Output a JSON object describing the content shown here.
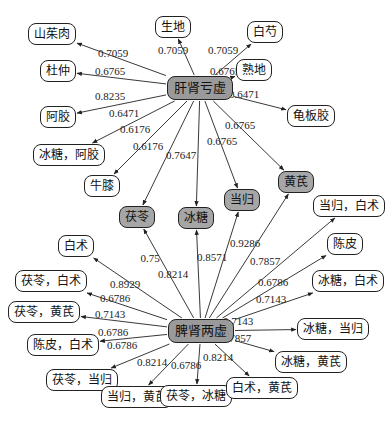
{
  "hubs": [
    {
      "id": "gsky",
      "label": "肝肾亏虚",
      "x": 200,
      "y": 88
    },
    {
      "id": "psly",
      "label": "脾肾两虚",
      "x": 201,
      "y": 331
    }
  ],
  "nodes": [
    {
      "id": "n1",
      "label": "山茱肉",
      "x": 52,
      "y": 34,
      "type": "leaf"
    },
    {
      "id": "n2",
      "label": "生地",
      "x": 173,
      "y": 27,
      "type": "leaf"
    },
    {
      "id": "n3",
      "label": "白芍",
      "x": 265,
      "y": 32,
      "type": "leaf"
    },
    {
      "id": "n4",
      "label": "杜仲",
      "x": 58,
      "y": 71,
      "type": "leaf"
    },
    {
      "id": "n5",
      "label": "熟地",
      "x": 254,
      "y": 70,
      "type": "leaf"
    },
    {
      "id": "n6",
      "label": "阿胶",
      "x": 58,
      "y": 117,
      "type": "leaf"
    },
    {
      "id": "n7",
      "label": "龟板胶",
      "x": 311,
      "y": 116,
      "type": "leaf"
    },
    {
      "id": "n8",
      "label": "冰糖，阿胶",
      "x": 69,
      "y": 155,
      "type": "leaf"
    },
    {
      "id": "n9",
      "label": "牛膝",
      "x": 102,
      "y": 186,
      "type": "leaf"
    },
    {
      "id": "n10",
      "label": "茯苓",
      "x": 137,
      "y": 217,
      "type": "shared"
    },
    {
      "id": "n11",
      "label": "冰糖",
      "x": 196,
      "y": 218,
      "type": "shared"
    },
    {
      "id": "n12",
      "label": "当归",
      "x": 242,
      "y": 200,
      "type": "shared"
    },
    {
      "id": "n13",
      "label": "黄芪",
      "x": 296,
      "y": 182,
      "type": "shared"
    },
    {
      "id": "n14",
      "label": "当归，白术",
      "x": 349,
      "y": 206,
      "type": "leaf"
    },
    {
      "id": "n15",
      "label": "陈皮",
      "x": 345,
      "y": 244,
      "type": "leaf"
    },
    {
      "id": "n16",
      "label": "白术",
      "x": 76,
      "y": 246,
      "type": "leaf"
    },
    {
      "id": "n17",
      "label": "冰糖，白术",
      "x": 348,
      "y": 281,
      "type": "leaf"
    },
    {
      "id": "n18",
      "label": "茯苓，白术",
      "x": 51,
      "y": 281,
      "type": "leaf"
    },
    {
      "id": "n19",
      "label": "茯苓，黄芪",
      "x": 44,
      "y": 312,
      "type": "leaf"
    },
    {
      "id": "n20",
      "label": "冰糖，当归",
      "x": 333,
      "y": 329,
      "type": "leaf"
    },
    {
      "id": "n21",
      "label": "陈皮，白术",
      "x": 63,
      "y": 345,
      "type": "leaf"
    },
    {
      "id": "n22",
      "label": "冰糖，黄芪",
      "x": 311,
      "y": 362,
      "type": "leaf"
    },
    {
      "id": "n23",
      "label": "茯苓，当归",
      "x": 82,
      "y": 380,
      "type": "leaf"
    },
    {
      "id": "n24",
      "label": "当归，黄芪",
      "x": 137,
      "y": 397,
      "type": "leaf"
    },
    {
      "id": "n25",
      "label": "茯苓，冰糖",
      "x": 196,
      "y": 396,
      "type": "leaf"
    },
    {
      "id": "n26",
      "label": "白术，黄芪",
      "x": 262,
      "y": 388,
      "type": "leaf"
    }
  ],
  "edges": [
    {
      "from": "gsky",
      "to": "n1",
      "weight": "0.7059",
      "lx": 113,
      "ly": 53
    },
    {
      "from": "gsky",
      "to": "n2",
      "weight": "0.7059",
      "lx": 173,
      "ly": 50
    },
    {
      "from": "gsky",
      "to": "n3",
      "weight": "0.7059",
      "lx": 223,
      "ly": 50
    },
    {
      "from": "gsky",
      "to": "n4",
      "weight": "0.6765",
      "lx": 110,
      "ly": 71
    },
    {
      "from": "gsky",
      "to": "n5",
      "weight": "0.6765",
      "lx": 225,
      "ly": 71
    },
    {
      "from": "gsky",
      "to": "n6",
      "weight": "0.8235",
      "lx": 110,
      "ly": 96
    },
    {
      "from": "gsky",
      "to": "n7",
      "weight": "0.6471",
      "lx": 244,
      "ly": 94
    },
    {
      "from": "gsky",
      "to": "n8",
      "weight": "0.6471",
      "lx": 124,
      "ly": 113
    },
    {
      "from": "gsky",
      "to": "n9",
      "weight": "0.6176",
      "lx": 135,
      "ly": 129
    },
    {
      "from": "gsky",
      "to": "n10",
      "weight": "0.6176",
      "lx": 148,
      "ly": 146
    },
    {
      "from": "gsky",
      "to": "n11",
      "weight": "0.7647",
      "lx": 181,
      "ly": 155
    },
    {
      "from": "gsky",
      "to": "n12",
      "weight": "0.6765",
      "lx": 222,
      "ly": 141
    },
    {
      "from": "gsky",
      "to": "n13",
      "weight": "0.6765",
      "lx": 240,
      "ly": 125
    },
    {
      "from": "psly",
      "to": "n10",
      "weight": "0.75",
      "lx": 150,
      "ly": 258
    },
    {
      "from": "psly",
      "to": "n11",
      "weight": "0.8214",
      "lx": 173,
      "ly": 274
    },
    {
      "from": "psly",
      "to": "n12",
      "weight": "0.8571",
      "lx": 212,
      "ly": 257
    },
    {
      "from": "psly",
      "to": "n13",
      "weight": "0.9286",
      "lx": 245,
      "ly": 243
    },
    {
      "from": "psly",
      "to": "n14",
      "weight": "0.7857",
      "lx": 265,
      "ly": 261
    },
    {
      "from": "psly",
      "to": "n15",
      "weight": "0.6786",
      "lx": 273,
      "ly": 282
    },
    {
      "from": "psly",
      "to": "n16",
      "weight": "0.8929",
      "lx": 125,
      "ly": 284
    },
    {
      "from": "psly",
      "to": "n17",
      "weight": "0.7143",
      "lx": 271,
      "ly": 299
    },
    {
      "from": "psly",
      "to": "n18",
      "weight": "0.6786",
      "lx": 115,
      "ly": 298
    },
    {
      "from": "psly",
      "to": "n19",
      "weight": "0.7143",
      "lx": 110,
      "ly": 314
    },
    {
      "from": "psly",
      "to": "n20",
      "weight": "0.7143",
      "lx": 238,
      "ly": 321
    },
    {
      "from": "psly",
      "to": "n21",
      "weight": "0.6786",
      "lx": 113,
      "ly": 332
    },
    {
      "from": "psly",
      "to": "n22",
      "weight": "0.7857",
      "lx": 236,
      "ly": 338
    },
    {
      "from": "psly",
      "to": "n23",
      "weight": "0.6786",
      "lx": 122,
      "ly": 345
    },
    {
      "from": "psly",
      "to": "n24",
      "weight": "0.8214",
      "lx": 152,
      "ly": 362
    },
    {
      "from": "psly",
      "to": "n25",
      "weight": "0.6786",
      "lx": 186,
      "ly": 365
    },
    {
      "from": "psly",
      "to": "n26",
      "weight": "0.8214",
      "lx": 218,
      "ly": 357
    }
  ],
  "colors": {
    "hub_fill": "#9a9a9a",
    "shared_fill": "#a6a6a6",
    "leaf_fill": "#ffffff",
    "stroke": "#222222"
  }
}
